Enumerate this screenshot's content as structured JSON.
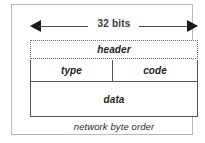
{
  "diagram": {
    "width_annotation": {
      "label": "32 bits",
      "arrow_left_icon": "arrow-left-icon",
      "arrow_right_icon": "arrow-right-icon"
    },
    "rows": [
      {
        "name": "header",
        "border": "dotted",
        "cells": [
          {
            "label": "header"
          }
        ]
      },
      {
        "name": "type-code",
        "border": "solid",
        "cells": [
          {
            "label": "type"
          },
          {
            "label": "code"
          }
        ]
      },
      {
        "name": "data",
        "border": "solid",
        "cells": [
          {
            "label": "data"
          }
        ]
      }
    ],
    "caption": "network byte order",
    "colors": {
      "outer_frame": "#b9b9b9",
      "solid_border": "#555555",
      "dotted_border": "#6b6b6b",
      "arrow": "#1a1a1a",
      "text": "#1f1f1f",
      "background": "#ffffff"
    }
  }
}
